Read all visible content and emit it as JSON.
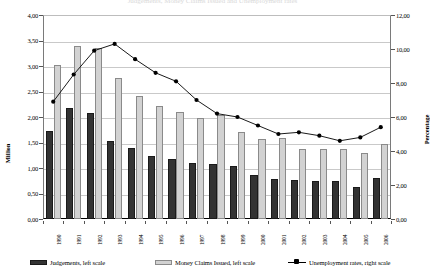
{
  "chart_data": {
    "type": "bar",
    "title": "Judgements, Money Claims Issued and Unemployment rates",
    "xlabel": "",
    "ylabel": "Million",
    "y2label": "Percentage",
    "ylim": [
      0,
      4.0
    ],
    "y2lim": [
      0,
      12.0
    ],
    "grid": true,
    "legend_position": "bottom",
    "categories": [
      "1990",
      "1991",
      "1992",
      "1993",
      "1994",
      "1995",
      "1996",
      "1997",
      "1998",
      "1999",
      "2000",
      "2001",
      "2002",
      "2003",
      "2004",
      "2005",
      "2006"
    ],
    "y_ticks": [
      "0,00",
      "0,50",
      "1,00",
      "1,50",
      "2,00",
      "2,50",
      "3,00",
      "3,50",
      "4,00"
    ],
    "y2_ticks": [
      "0,00",
      "2,00",
      "4,00",
      "6,00",
      "8,00",
      "10,00",
      "12,00"
    ],
    "series": [
      {
        "name": "Judgements, left scale",
        "axis": "left",
        "type": "bar",
        "color": "#333333",
        "values": [
          1.72,
          2.18,
          2.07,
          1.52,
          1.39,
          1.23,
          1.17,
          1.1,
          1.07,
          1.03,
          0.86,
          0.78,
          0.76,
          0.75,
          0.74,
          0.63,
          0.81
        ]
      },
      {
        "name": "Money Claims Issued, left scale",
        "axis": "left",
        "type": "bar",
        "color": "#d2d2d2",
        "values": [
          3.02,
          3.4,
          3.35,
          2.76,
          2.42,
          2.22,
          2.1,
          1.98,
          2.04,
          1.7,
          1.56,
          1.58,
          1.38,
          1.38,
          1.38,
          1.3,
          1.47
        ]
      },
      {
        "name": "Unemployment rates, right scale",
        "axis": "right",
        "type": "line",
        "color": "#000000",
        "marker": "circle",
        "values": [
          6.9,
          8.5,
          9.9,
          10.3,
          9.4,
          8.6,
          8.1,
          7.0,
          6.2,
          6.0,
          5.5,
          5.0,
          5.1,
          4.9,
          4.6,
          4.8,
          5.4
        ]
      }
    ]
  }
}
